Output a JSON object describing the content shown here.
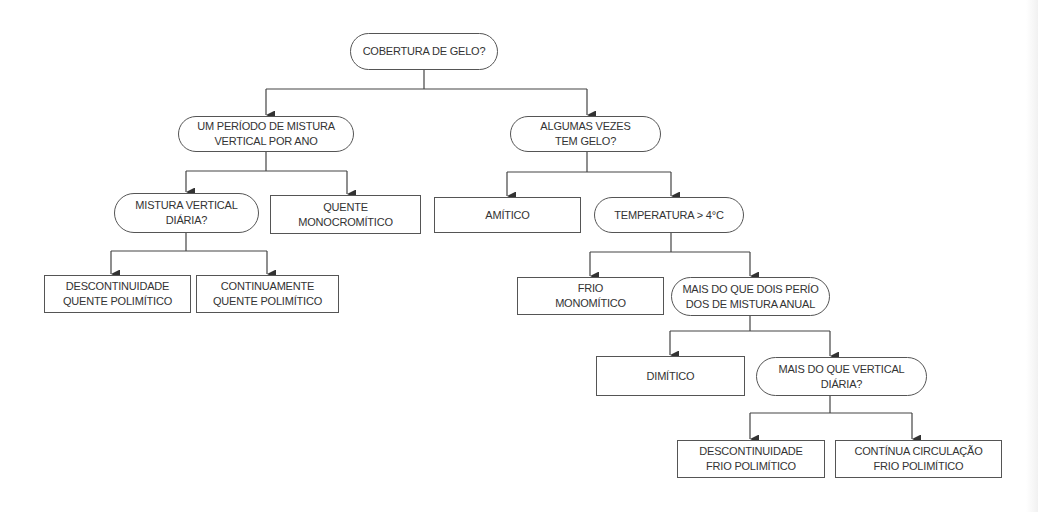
{
  "diagram": {
    "type": "decision-tree",
    "colors": {
      "line": "#444444",
      "border": "#555555",
      "text": "#333333",
      "background": "#ffffff"
    },
    "nodes": {
      "root": {
        "kind": "decision",
        "lines": [
          "Cobertura de gelo?"
        ]
      },
      "one_period": {
        "kind": "decision",
        "lines": [
          "Um período de mistura",
          "vertical por ano"
        ]
      },
      "sometimes_ice": {
        "kind": "decision",
        "lines": [
          "Algumas vezes",
          "tem gelo?"
        ]
      },
      "daily_mixing": {
        "kind": "decision",
        "lines": [
          "Mistura vertical",
          "diária?"
        ]
      },
      "warm_mono": {
        "kind": "leaf",
        "lines": [
          "Quente",
          "monocromítico"
        ]
      },
      "amictic": {
        "kind": "leaf",
        "lines": [
          "Amítico"
        ]
      },
      "temperature": {
        "kind": "decision",
        "lines": [
          "Temperatura > 4°C"
        ]
      },
      "disc_warm_poly": {
        "kind": "leaf",
        "lines": [
          "Descontinuidade",
          "quente polimítico"
        ]
      },
      "cont_warm_poly": {
        "kind": "leaf",
        "lines": [
          "Continuamente",
          "quente polimítico"
        ]
      },
      "cold_mono": {
        "kind": "leaf",
        "lines": [
          "Frio",
          "monomítico"
        ]
      },
      "more_than_two": {
        "kind": "decision",
        "lines": [
          "Mais do que dois perío",
          "dos de mistura anual"
        ]
      },
      "dimictic": {
        "kind": "leaf",
        "lines": [
          "Dimítico"
        ]
      },
      "more_than_vertical": {
        "kind": "decision",
        "lines": [
          "Mais do que vertical",
          "diária?"
        ]
      },
      "disc_cold_poly": {
        "kind": "leaf",
        "lines": [
          "Descontinuidade",
          "Frio polimítico"
        ]
      },
      "cont_cold_poly": {
        "kind": "leaf",
        "lines": [
          "Contínua circulação",
          "Frio polimítico"
        ]
      }
    },
    "edges": [
      [
        "root",
        "one_period"
      ],
      [
        "root",
        "sometimes_ice"
      ],
      [
        "one_period",
        "daily_mixing"
      ],
      [
        "one_period",
        "warm_mono"
      ],
      [
        "daily_mixing",
        "disc_warm_poly"
      ],
      [
        "daily_mixing",
        "cont_warm_poly"
      ],
      [
        "sometimes_ice",
        "amictic"
      ],
      [
        "sometimes_ice",
        "temperature"
      ],
      [
        "temperature",
        "cold_mono"
      ],
      [
        "temperature",
        "more_than_two"
      ],
      [
        "more_than_two",
        "dimictic"
      ],
      [
        "more_than_two",
        "more_than_vertical"
      ],
      [
        "more_than_vertical",
        "disc_cold_poly"
      ],
      [
        "more_than_vertical",
        "cont_cold_poly"
      ]
    ]
  }
}
